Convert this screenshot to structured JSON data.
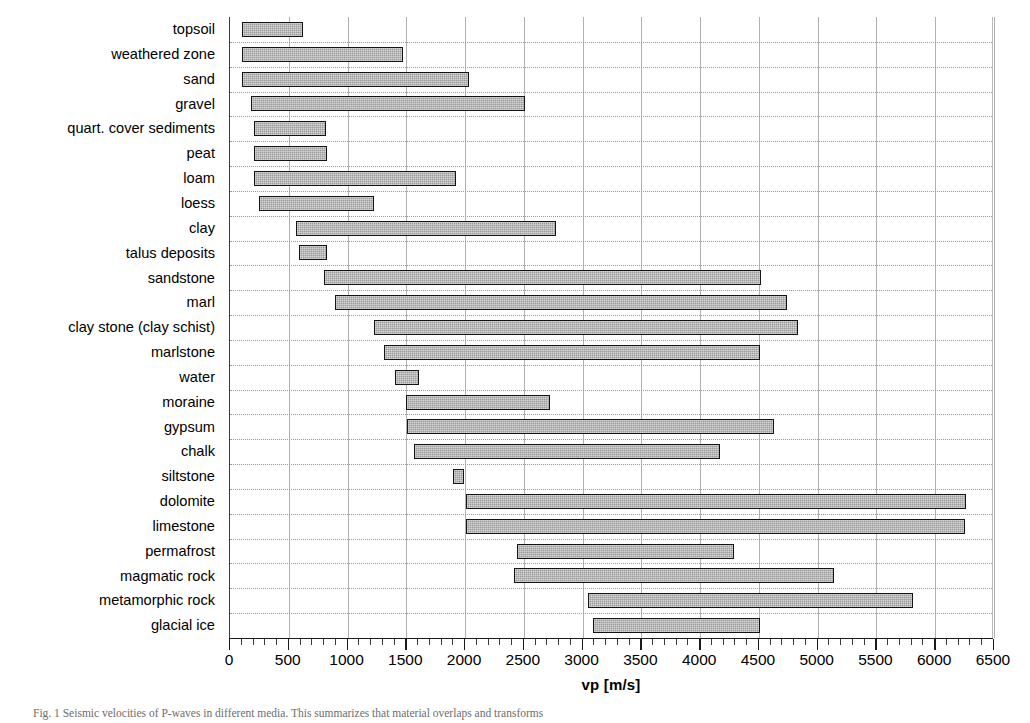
{
  "figure": {
    "caption": "Fig. 1   Seismic velocities of P-waves in different media. This summarizes that material overlaps and transforms",
    "axis_title": "vp [m/s]"
  },
  "chart_data": {
    "type": "bar",
    "orientation": "horizontal-range",
    "title": "",
    "xlabel": "vp [m/s]",
    "ylabel": "",
    "xlim": [
      0,
      6500
    ],
    "xticks": [
      0,
      500,
      1000,
      1500,
      2000,
      2500,
      3000,
      3500,
      4000,
      4500,
      5000,
      5500,
      6000,
      6500
    ],
    "xtick_labels": [
      "0",
      "500",
      "1000",
      "1500",
      "2000",
      "2500",
      "3000",
      "3500",
      "4000",
      "4500",
      "5000",
      "5500",
      "6000",
      "6500"
    ],
    "minor_tick_interval": 100,
    "grid": "both",
    "legend": "none",
    "bar_fill": "#9c9c9c",
    "bar_border": "#141414",
    "categories": [
      "topsoil",
      "weathered zone",
      "sand",
      "gravel",
      "quart. cover sediments",
      "peat",
      "loam",
      "loess",
      "clay",
      "talus deposits",
      "sandstone",
      "marl",
      "clay stone (clay schist)",
      "marlstone",
      "water",
      "moraine",
      "gypsum",
      "chalk",
      "siltstone",
      "dolomite",
      "limestone",
      "permafrost",
      "magmatic rock",
      "metamorphic rock",
      "glacial ice"
    ],
    "ranges": [
      {
        "label": "topsoil",
        "min": 100,
        "max": 620
      },
      {
        "label": "weathered zone",
        "min": 100,
        "max": 1470
      },
      {
        "label": "sand",
        "min": 100,
        "max": 2030
      },
      {
        "label": "gravel",
        "min": 180,
        "max": 2510
      },
      {
        "label": "quart. cover sediments",
        "min": 200,
        "max": 815
      },
      {
        "label": "peat",
        "min": 200,
        "max": 825
      },
      {
        "label": "loam",
        "min": 200,
        "max": 1920
      },
      {
        "label": "loess",
        "min": 250,
        "max": 1225
      },
      {
        "label": "clay",
        "min": 560,
        "max": 2770
      },
      {
        "label": "talus deposits",
        "min": 590,
        "max": 825
      },
      {
        "label": "sandstone",
        "min": 800,
        "max": 4520
      },
      {
        "label": "marl",
        "min": 890,
        "max": 4740
      },
      {
        "label": "clay stone (clay schist)",
        "min": 1225,
        "max": 4830
      },
      {
        "label": "marlstone",
        "min": 1310,
        "max": 4510
      },
      {
        "label": "water",
        "min": 1405,
        "max": 1610
      },
      {
        "label": "moraine",
        "min": 1500,
        "max": 2720
      },
      {
        "label": "gypsum",
        "min": 1510,
        "max": 4625
      },
      {
        "label": "chalk",
        "min": 1565,
        "max": 4165
      },
      {
        "label": "siltstone",
        "min": 1900,
        "max": 1990
      },
      {
        "label": "dolomite",
        "min": 2005,
        "max": 6260
      },
      {
        "label": "limestone",
        "min": 2010,
        "max": 6250
      },
      {
        "label": "permafrost",
        "min": 2440,
        "max": 4285
      },
      {
        "label": "magmatic rock",
        "min": 2420,
        "max": 5140
      },
      {
        "label": "metamorphic rock",
        "min": 3045,
        "max": 5810
      },
      {
        "label": "glacial ice",
        "min": 3090,
        "max": 4510
      }
    ]
  }
}
